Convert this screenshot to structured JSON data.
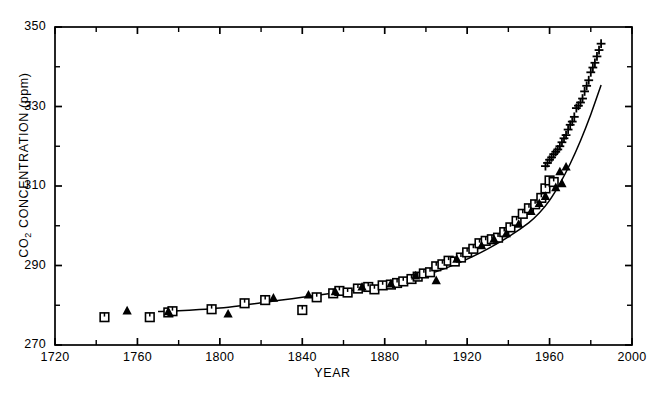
{
  "chart_data": {
    "type": "scatter",
    "title": "",
    "xlabel": "YEAR",
    "ylabel": "CO2 CONCENTRATION (ppm)",
    "ylabel_parts": {
      "prefix": "CO",
      "sub": "2",
      "suffix": " CONCENTRATION (ppm)"
    },
    "xlim": [
      1720,
      2000
    ],
    "ylim": [
      270,
      350
    ],
    "xticks_major": [
      1720,
      1760,
      1800,
      1840,
      1880,
      1920,
      1960,
      2000
    ],
    "xtick_labels": [
      "1720",
      "1760",
      "1800",
      "1840",
      "1880",
      "1920",
      "1960",
      "2000"
    ],
    "xticks_minor": [
      1740,
      1780,
      1820,
      1860,
      1900,
      1940,
      1980
    ],
    "yticks_major": [
      270,
      290,
      310,
      330,
      350
    ],
    "ytick_labels": [
      "270",
      "290",
      "310",
      "330",
      "350"
    ],
    "yticks_minor": [
      280,
      300,
      320,
      340
    ],
    "grid": false,
    "legend": "none",
    "axis_color": "#000000",
    "series": [
      {
        "name": "ice-core-squares",
        "marker": "open-square",
        "color": "#000000",
        "points": [
          [
            1744,
            277.0
          ],
          [
            1766,
            277.0
          ],
          [
            1775,
            278.2
          ],
          [
            1777,
            278.5
          ],
          [
            1796,
            279.0
          ],
          [
            1812,
            280.5
          ],
          [
            1822,
            281.3
          ],
          [
            1840,
            278.8
          ],
          [
            1847,
            282.0
          ],
          [
            1855,
            283.0
          ],
          [
            1858,
            283.6
          ],
          [
            1862,
            283.2
          ],
          [
            1867,
            284.2
          ],
          [
            1872,
            284.6
          ],
          [
            1875,
            284.0
          ],
          [
            1879,
            285.0
          ],
          [
            1883,
            285.2
          ],
          [
            1886,
            285.6
          ],
          [
            1889,
            286.0
          ],
          [
            1893,
            286.6
          ],
          [
            1896,
            287.2
          ],
          [
            1899,
            288.0
          ],
          [
            1902,
            288.3
          ],
          [
            1905,
            289.8
          ],
          [
            1908,
            290.3
          ],
          [
            1911,
            291.2
          ],
          [
            1914,
            291.0
          ],
          [
            1917,
            292.0
          ],
          [
            1920,
            293.3
          ],
          [
            1923,
            294.2
          ],
          [
            1926,
            295.6
          ],
          [
            1929,
            296.2
          ],
          [
            1932,
            296.6
          ],
          [
            1935,
            297.0
          ],
          [
            1938,
            298.4
          ],
          [
            1941,
            299.6
          ],
          [
            1944,
            301.2
          ],
          [
            1947,
            303.0
          ],
          [
            1950,
            304.4
          ],
          [
            1953,
            305.4
          ],
          [
            1956,
            307.0
          ],
          [
            1958,
            309.4
          ],
          [
            1960,
            311.4
          ],
          [
            1962,
            311.0
          ]
        ]
      },
      {
        "name": "ice-core-triangles",
        "marker": "filled-triangle",
        "color": "#000000",
        "points": [
          [
            1755,
            278.6
          ],
          [
            1775,
            278.4
          ],
          [
            1804,
            277.8
          ],
          [
            1826,
            281.8
          ],
          [
            1843,
            282.6
          ],
          [
            1856,
            283.4
          ],
          [
            1869,
            284.6
          ],
          [
            1883,
            285.4
          ],
          [
            1895,
            287.4
          ],
          [
            1905,
            286.2
          ],
          [
            1915,
            291.6
          ],
          [
            1927,
            295.0
          ],
          [
            1933,
            296.6
          ],
          [
            1939,
            298.0
          ],
          [
            1945,
            300.4
          ],
          [
            1951,
            303.6
          ],
          [
            1955,
            305.6
          ],
          [
            1958,
            307.4
          ],
          [
            1963,
            309.6
          ],
          [
            1966,
            310.6
          ],
          [
            1965,
            313.6
          ],
          [
            1968,
            314.8
          ]
        ]
      },
      {
        "name": "mauna-loa-plus",
        "marker": "plus",
        "color": "#000000",
        "points": [
          [
            1958,
            315.0
          ],
          [
            1959,
            315.8
          ],
          [
            1960,
            316.6
          ],
          [
            1961,
            317.2
          ],
          [
            1962,
            318.0
          ],
          [
            1963,
            318.6
          ],
          [
            1964,
            319.2
          ],
          [
            1965,
            320.0
          ],
          [
            1966,
            321.0
          ],
          [
            1967,
            322.0
          ],
          [
            1968,
            322.8
          ],
          [
            1969,
            324.2
          ],
          [
            1970,
            325.4
          ],
          [
            1971,
            326.2
          ],
          [
            1972,
            327.4
          ],
          [
            1973,
            329.6
          ],
          [
            1974,
            330.2
          ],
          [
            1975,
            331.0
          ],
          [
            1976,
            332.0
          ],
          [
            1977,
            333.8
          ],
          [
            1978,
            335.2
          ],
          [
            1979,
            336.6
          ],
          [
            1980,
            338.6
          ],
          [
            1981,
            339.8
          ],
          [
            1982,
            341.0
          ],
          [
            1983,
            342.6
          ],
          [
            1984,
            344.2
          ],
          [
            1985,
            345.8
          ]
        ]
      }
    ],
    "fit_curve": {
      "name": "smooth-fit",
      "color": "#000000",
      "points": [
        [
          1770,
          278.4
        ],
        [
          1780,
          278.6
        ],
        [
          1790,
          278.9
        ],
        [
          1800,
          279.3
        ],
        [
          1810,
          279.9
        ],
        [
          1820,
          280.6
        ],
        [
          1830,
          281.3
        ],
        [
          1840,
          282.0
        ],
        [
          1850,
          282.7
        ],
        [
          1860,
          283.4
        ],
        [
          1870,
          284.2
        ],
        [
          1880,
          285.1
        ],
        [
          1890,
          286.2
        ],
        [
          1900,
          287.6
        ],
        [
          1910,
          289.4
        ],
        [
          1920,
          291.6
        ],
        [
          1930,
          294.2
        ],
        [
          1940,
          297.2
        ],
        [
          1950,
          300.8
        ],
        [
          1955,
          303.2
        ],
        [
          1960,
          306.4
        ],
        [
          1965,
          310.6
        ],
        [
          1970,
          315.6
        ],
        [
          1975,
          321.4
        ],
        [
          1980,
          328.0
        ],
        [
          1985,
          335.4
        ]
      ]
    }
  },
  "caption": ""
}
